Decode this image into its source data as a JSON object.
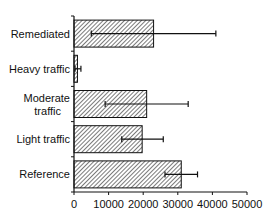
{
  "chart_data": {
    "type": "bar",
    "orientation": "horizontal",
    "title": "",
    "xlabel": "",
    "ylabel": "",
    "categories": [
      "Remediated",
      "Heavy traffic",
      "Moderate traffic",
      "Light traffic",
      "Reference"
    ],
    "category_lines": [
      [
        "Remediated"
      ],
      [
        "Heavy traffic"
      ],
      [
        "Moderate",
        "traffic"
      ],
      [
        "Light traffic"
      ],
      [
        "Reference"
      ]
    ],
    "values": [
      23000,
      1000,
      21000,
      19700,
      31000
    ],
    "error_low": [
      5000,
      300,
      9000,
      13800,
      26300
    ],
    "error_high": [
      41000,
      2000,
      33000,
      25800,
      35700
    ],
    "xlim": [
      0,
      50000
    ],
    "xticks": [
      0,
      10000,
      20000,
      30000,
      40000,
      50000
    ],
    "xtick_labels": [
      "0",
      "10000",
      "20000",
      "30000",
      "40000",
      "50000"
    ],
    "bar_fill": "hatched",
    "bar_color": "#333333",
    "grid": false,
    "legend": null
  }
}
